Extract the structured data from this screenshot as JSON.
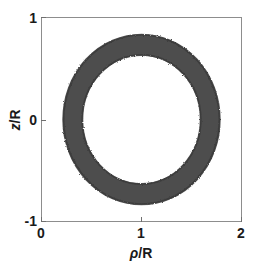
{
  "chart_data": {
    "type": "area",
    "title": "",
    "subtitle": "",
    "xlabel_rho": "ρ",
    "xlabel_sep": "/",
    "xlabel_unit": "R",
    "ylabel_z": "z",
    "ylabel_sep": "/",
    "ylabel_unit": "R",
    "xlim": [
      0,
      2
    ],
    "ylim": [
      -1,
      1
    ],
    "xticks": [
      0,
      1,
      2
    ],
    "xtick_labels": [
      "0",
      "1",
      "2"
    ],
    "yticks": [
      -1,
      0,
      1
    ],
    "ytick_labels": [
      "-1",
      "0",
      "1"
    ],
    "grid": false,
    "legend": "none",
    "series": [
      {
        "name": "annulus",
        "shape": "annulus",
        "center_x": 1.0,
        "center_y": 0.0,
        "outer_radius_x": 0.79,
        "outer_radius_y": 0.84,
        "inner_radius_x": 0.59,
        "inner_radius_y": 0.63,
        "fill_color": "#4d4d4d",
        "edge_color": "#3a3a3a",
        "edge_roughness": "speckled"
      }
    ],
    "frame_color": "#8d8d8d",
    "background_color": "#ffffff",
    "text_color": "#1a1a1a"
  },
  "figure": {
    "width": 257,
    "height": 269,
    "background": "#ffffff"
  }
}
